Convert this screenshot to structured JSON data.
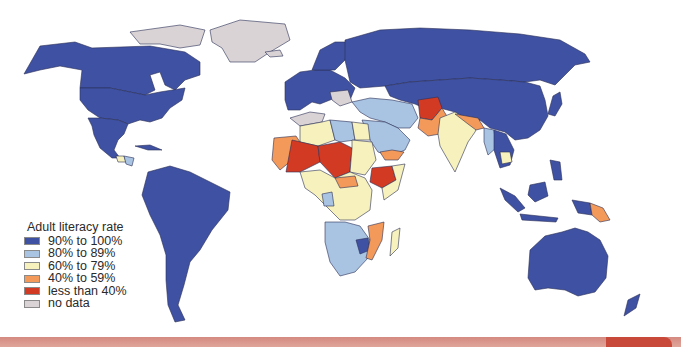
{
  "legend": {
    "title": "Adult literacy rate",
    "items": [
      {
        "label": "90% to 100%",
        "color": "#3f51a3"
      },
      {
        "label": "80% to 89%",
        "color": "#a9c3e2"
      },
      {
        "label": "60% to 79%",
        "color": "#f6f1bd"
      },
      {
        "label": "40% to 59%",
        "color": "#f39a5a"
      },
      {
        "label": "less than 40%",
        "color": "#d23a24"
      },
      {
        "label": "no data",
        "color": "#d9d3d6"
      }
    ]
  },
  "colors": {
    "c90": "#3f51a3",
    "c80": "#a9c3e2",
    "c60": "#f6f1bd",
    "c40": "#f39a5a",
    "c0": "#d23a24",
    "nd": "#d9d3d6",
    "border": "#2a2f55",
    "strip": "#d48a80",
    "strip_cap": "#c8493a"
  }
}
